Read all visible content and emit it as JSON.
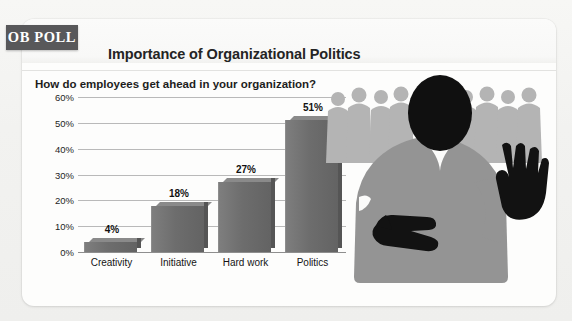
{
  "badge": {
    "label": "OB POLL"
  },
  "header": {
    "title": "Importance of Organizational Politics",
    "subtitle": "How do employees get ahead in your organization?"
  },
  "chart_data": {
    "type": "bar",
    "title": "Importance of Organizational Politics",
    "subtitle": "How do employees get ahead in your organization?",
    "categories": [
      "Creativity",
      "Initiative",
      "Hard work",
      "Politics"
    ],
    "values": [
      4,
      18,
      27,
      51
    ],
    "value_labels": [
      "4%",
      "18%",
      "27%",
      "51%"
    ],
    "xlabel": "",
    "ylabel": "",
    "ylim": [
      0,
      60
    ],
    "ytick_step": 10,
    "ytick_labels": [
      "60%",
      "50%",
      "40%",
      "30%",
      "20%",
      "10%",
      "0%"
    ],
    "ytick_values": [
      60,
      50,
      40,
      30,
      20,
      10,
      0
    ],
    "grid": true,
    "legend": false,
    "bar_color": "#6d6d6d",
    "gridline_color": "#b9b9b9"
  },
  "illustration": {
    "name": "businessman-crossed-fingers-behind-back-with-crowd",
    "figure_suit_color": "#949494",
    "figure_head_color": "#101010",
    "crowd_color": "#b3b3b3",
    "hand_color": "#121212"
  },
  "colors": {
    "badge_bg": "#58585a",
    "badge_text": "#ffffff",
    "card_bg": "#fdfdfc",
    "page_bg": "#f2f2f0",
    "title_text": "#242424"
  }
}
